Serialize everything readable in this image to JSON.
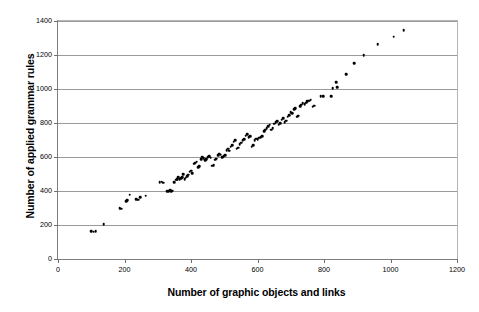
{
  "chart_data": {
    "type": "scatter",
    "title": "",
    "xlabel": "Number of graphic objects and links",
    "ylabel": "Number of applied grammar rules",
    "xlim": [
      0,
      1200
    ],
    "ylim": [
      0,
      1400
    ],
    "xticks": [
      0,
      200,
      400,
      600,
      800,
      1000,
      1200
    ],
    "yticks": [
      0,
      200,
      400,
      600,
      800,
      1000,
      1200,
      1400
    ],
    "xtick_labels": [
      "0",
      "200",
      "400",
      "600",
      "800",
      "1000",
      "1200"
    ],
    "ytick_labels": [
      "0",
      "200",
      "400",
      "600",
      "800",
      "1000",
      "1200",
      "1400"
    ],
    "grid": "horizontal",
    "legend": "none",
    "marker": "filled-circle",
    "marker_color": "#000000",
    "points": [
      [
        100,
        162
      ],
      [
        107,
        160
      ],
      [
        113,
        163
      ],
      [
        137,
        205
      ],
      [
        186,
        300
      ],
      [
        190,
        297
      ],
      [
        205,
        340
      ],
      [
        209,
        345
      ],
      [
        216,
        378
      ],
      [
        236,
        352
      ],
      [
        241,
        350
      ],
      [
        247,
        362
      ],
      [
        264,
        372
      ],
      [
        306,
        452
      ],
      [
        312,
        455
      ],
      [
        316,
        448
      ],
      [
        328,
        398
      ],
      [
        333,
        400
      ],
      [
        337,
        404
      ],
      [
        341,
        398
      ],
      [
        345,
        402
      ],
      [
        350,
        452
      ],
      [
        356,
        466
      ],
      [
        359,
        470
      ],
      [
        362,
        480
      ],
      [
        366,
        470
      ],
      [
        370,
        476
      ],
      [
        373,
        482
      ],
      [
        377,
        500
      ],
      [
        381,
        470
      ],
      [
        384,
        478
      ],
      [
        388,
        488
      ],
      [
        392,
        496
      ],
      [
        396,
        513
      ],
      [
        400,
        520
      ],
      [
        404,
        505
      ],
      [
        409,
        560
      ],
      [
        413,
        566
      ],
      [
        417,
        572
      ],
      [
        421,
        540
      ],
      [
        425,
        546
      ],
      [
        430,
        588
      ],
      [
        434,
        600
      ],
      [
        438,
        592
      ],
      [
        442,
        580
      ],
      [
        446,
        586
      ],
      [
        450,
        598
      ],
      [
        455,
        604
      ],
      [
        459,
        596
      ],
      [
        463,
        548
      ],
      [
        468,
        552
      ],
      [
        472,
        585
      ],
      [
        476,
        590
      ],
      [
        481,
        612
      ],
      [
        485,
        620
      ],
      [
        489,
        614
      ],
      [
        494,
        600
      ],
      [
        498,
        606
      ],
      [
        502,
        612
      ],
      [
        507,
        640
      ],
      [
        511,
        648
      ],
      [
        515,
        636
      ],
      [
        520,
        660
      ],
      [
        524,
        668
      ],
      [
        529,
        690
      ],
      [
        533,
        700
      ],
      [
        538,
        648
      ],
      [
        542,
        655
      ],
      [
        547,
        676
      ],
      [
        551,
        684
      ],
      [
        556,
        700
      ],
      [
        560,
        706
      ],
      [
        565,
        726
      ],
      [
        569,
        734
      ],
      [
        574,
        716
      ],
      [
        578,
        722
      ],
      [
        583,
        660
      ],
      [
        587,
        668
      ],
      [
        592,
        700
      ],
      [
        596,
        708
      ],
      [
        601,
        706
      ],
      [
        605,
        714
      ],
      [
        610,
        716
      ],
      [
        614,
        722
      ],
      [
        620,
        752
      ],
      [
        624,
        760
      ],
      [
        628,
        768
      ],
      [
        633,
        782
      ],
      [
        637,
        790
      ],
      [
        642,
        760
      ],
      [
        646,
        768
      ],
      [
        651,
        796
      ],
      [
        655,
        804
      ],
      [
        659,
        812
      ],
      [
        664,
        790
      ],
      [
        668,
        798
      ],
      [
        673,
        820
      ],
      [
        677,
        828
      ],
      [
        682,
        806
      ],
      [
        686,
        814
      ],
      [
        691,
        838
      ],
      [
        695,
        846
      ],
      [
        700,
        862
      ],
      [
        704,
        856
      ],
      [
        710,
        880
      ],
      [
        714,
        886
      ],
      [
        719,
        838
      ],
      [
        723,
        844
      ],
      [
        728,
        900
      ],
      [
        732,
        908
      ],
      [
        736,
        916
      ],
      [
        742,
        912
      ],
      [
        746,
        920
      ],
      [
        750,
        928
      ],
      [
        756,
        930
      ],
      [
        760,
        938
      ],
      [
        766,
        896
      ],
      [
        770,
        902
      ],
      [
        790,
        956
      ],
      [
        798,
        956
      ],
      [
        822,
        958
      ],
      [
        826,
        1005
      ],
      [
        836,
        1040
      ],
      [
        840,
        1012
      ],
      [
        866,
        1088
      ],
      [
        890,
        1152
      ],
      [
        920,
        1198
      ],
      [
        962,
        1262
      ],
      [
        1010,
        1308
      ],
      [
        1040,
        1345
      ]
    ]
  }
}
